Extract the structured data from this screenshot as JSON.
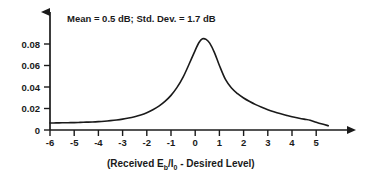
{
  "chart_data": {
    "type": "line",
    "title": "",
    "annotation": "Mean = 0.5 dB; Std. Dev. = 1.7 dB",
    "annotation_parts": {
      "mean_label": "Mean = 0.5 dB;",
      "stddev_label": "Std. Dev. = 1.7 dB",
      "mean_value": 0.5,
      "stddev_value": 1.7,
      "units": "dB"
    },
    "xlabel": "(Received Eb/I0 - Desired Level)",
    "xlabel_parts": {
      "prefix": "(Received E",
      "sub1": "b",
      "mid": "/I",
      "sub2": "0",
      "suffix": " - Desired Level)"
    },
    "ylabel": "",
    "xlim": [
      -6,
      5.6
    ],
    "ylim": [
      0,
      0.095
    ],
    "xticks": [
      -6,
      -5,
      -4,
      -3,
      -2,
      -1,
      0,
      1,
      2,
      3,
      4,
      5
    ],
    "xticklabels": [
      "-6",
      "-5",
      "-4",
      "-3",
      "-2",
      "-1",
      "0",
      "1",
      "2",
      "3",
      "4",
      "5"
    ],
    "yticks": [
      0,
      0.02,
      0.04,
      0.06,
      0.08
    ],
    "yticklabels": [
      "0",
      "0.02",
      "0.04",
      "0.06",
      "0.08"
    ],
    "grid": false,
    "legend": null,
    "axis_style": "arrow-ended",
    "line_color": "#1a1a1a",
    "line_width": 1.6,
    "x": [
      -6.0,
      -5.75,
      -5.5,
      -5.25,
      -5.0,
      -4.75,
      -4.5,
      -4.25,
      -4.0,
      -3.75,
      -3.5,
      -3.25,
      -3.0,
      -2.75,
      -2.5,
      -2.25,
      -2.0,
      -1.75,
      -1.5,
      -1.25,
      -1.0,
      -0.75,
      -0.5,
      -0.25,
      0.0,
      0.15,
      0.3,
      0.45,
      0.6,
      0.8,
      1.0,
      1.25,
      1.5,
      1.75,
      2.0,
      2.25,
      2.5,
      2.75,
      3.0,
      3.25,
      3.5,
      3.75,
      4.0,
      4.25,
      4.5,
      4.75,
      5.0,
      5.25,
      5.5
    ],
    "y": [
      0.0065,
      0.0066,
      0.0067,
      0.0068,
      0.0069,
      0.0071,
      0.0073,
      0.0075,
      0.0078,
      0.0082,
      0.0087,
      0.0093,
      0.0101,
      0.0111,
      0.0124,
      0.014,
      0.0161,
      0.0188,
      0.0222,
      0.0266,
      0.0322,
      0.0396,
      0.0492,
      0.0614,
      0.0741,
      0.0812,
      0.0848,
      0.0843,
      0.0808,
      0.0718,
      0.06,
      0.047,
      0.039,
      0.0338,
      0.0298,
      0.0265,
      0.0236,
      0.0211,
      0.0189,
      0.017,
      0.0153,
      0.0138,
      0.0124,
      0.0112,
      0.0101,
      0.0091,
      0.0072,
      0.0055,
      0.004
    ],
    "peak": {
      "x": 0.3,
      "y": 0.085
    }
  }
}
